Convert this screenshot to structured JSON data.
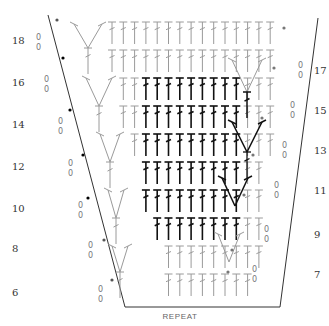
{
  "diagram": {
    "header_partial": "",
    "repeat_label": "REPEAT",
    "left_row_numbers": [
      "18",
      "16",
      "14",
      "12",
      "10",
      "8",
      "6"
    ],
    "right_row_numbers": [
      "17",
      "15",
      "13",
      "11",
      "9",
      "7"
    ],
    "chain_mark": "0",
    "stitch_symbol": "treble-crochet",
    "colors": {
      "dark_stitch": "#111111",
      "light_stitch": "#9a9a9a",
      "outline": "#333333"
    }
  }
}
